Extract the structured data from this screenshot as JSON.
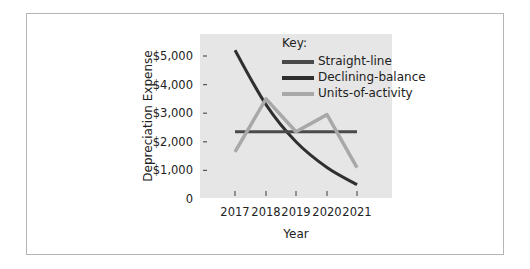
{
  "chart_data": {
    "type": "line",
    "title": "",
    "xlabel": "Year",
    "ylabel": "Depreciation Expense",
    "x": [
      "2017",
      "2018",
      "2019",
      "2020",
      "2021"
    ],
    "ylim": [
      0,
      5500
    ],
    "yticks": [
      0,
      1000,
      2000,
      3000,
      4000,
      5000
    ],
    "ytick_labels": [
      "0",
      "$1,000",
      "$2,000",
      "$3,000",
      "$4,000",
      "$5,000"
    ],
    "legend_title": "Key:",
    "legend_position": "top-right inside plot",
    "grid": false,
    "series": [
      {
        "name": "Straight-line",
        "color": "#4a4a4a",
        "values": [
          2350,
          2350,
          2350,
          2350,
          2350
        ]
      },
      {
        "name": "Declining-balance",
        "color": "#2f2f2f",
        "values": [
          5200,
          3300,
          2000,
          1100,
          500
        ],
        "curve": true
      },
      {
        "name": "Units-of-activity",
        "color": "#a8a8a8",
        "values": [
          1650,
          3500,
          2350,
          2950,
          1100
        ]
      }
    ]
  },
  "colors": {
    "plot_background": "#e6e6e6",
    "frame_border": "#b5b5b5"
  }
}
